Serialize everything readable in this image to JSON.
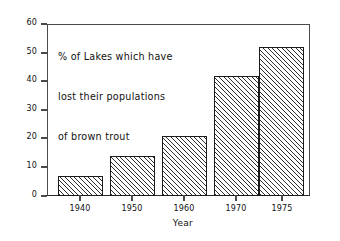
{
  "chart_data": {
    "type": "bar",
    "title": "% of Lakes which have lost their populations of brown trout",
    "title_lines": [
      "% of Lakes which have",
      "lost their populations",
      "of brown trout"
    ],
    "categories": [
      "1940",
      "1950",
      "1960",
      "1970",
      "1975"
    ],
    "values": [
      7,
      14,
      21,
      42,
      52
    ],
    "xlabel": "Year",
    "ylabel": "",
    "ylim": [
      0,
      60
    ],
    "yticks": [
      "0",
      "10",
      "20",
      "30",
      "40",
      "50",
      "60"
    ],
    "ytick_values": [
      0,
      10,
      20,
      30,
      40,
      50,
      60
    ],
    "grid": false,
    "legend": false,
    "bar_fill": "diagonal-hatch",
    "colors": {
      "axis": "#4a4a4a",
      "bar_outline": "#1b1b1b",
      "hatch": "#2e2e2e",
      "background": "#ffffff",
      "text": "#111111"
    }
  }
}
